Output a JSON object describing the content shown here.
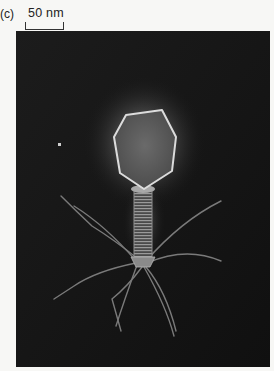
{
  "figure": {
    "panel_label": "(c)",
    "scale_bar": {
      "label": "50 nm"
    },
    "image": {
      "subject": "bacteriophage-micrograph",
      "description": "Electron micrograph of a T4-like bacteriophage: hexagonal head, striated contractile tail, baseplate and long tail fibers on dark background",
      "colors": {
        "background": "#141414",
        "glow": "#9a9a9a",
        "outline": "#d8d8d8",
        "page": "#f7f7f5"
      }
    }
  }
}
